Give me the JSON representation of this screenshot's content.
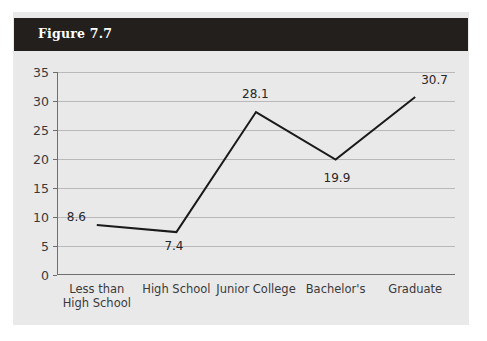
{
  "figure": {
    "title": "Figure 7.7"
  },
  "colors": {
    "header_background": "#231f1d",
    "header_text": "#ffffff",
    "panel_background": "#e9e9ea",
    "gridline": "#b9b9bb",
    "axis": "#6e6e70",
    "series_line": "#1a1a1a",
    "tick_text": "#3a3a3c"
  },
  "chart_data": {
    "type": "line",
    "title": "Figure 7.7",
    "xlabel": "",
    "ylabel": "",
    "categories": [
      "Less than\nHigh School",
      "High School",
      "Junior College",
      "Bachelor's",
      "Graduate"
    ],
    "values": [
      8.6,
      7.4,
      28.1,
      19.9,
      30.7
    ],
    "point_labels": [
      "8.6",
      "7.4",
      "28.1",
      "19.9",
      "30.7"
    ],
    "ylim": [
      0,
      35
    ],
    "yticks": [
      0,
      5,
      10,
      15,
      20,
      25,
      30,
      35
    ],
    "ytick_labels": [
      "0",
      "5",
      "10",
      "15",
      "20",
      "25",
      "30",
      "35"
    ],
    "grid": true,
    "legend": null,
    "legend_position": "none",
    "marker": "none",
    "line_width": 2
  }
}
